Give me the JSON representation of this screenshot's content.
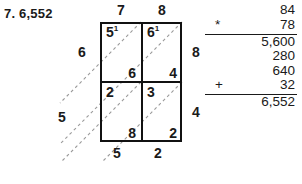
{
  "problem": {
    "number": "7.",
    "answer": "6,552"
  },
  "lattice": {
    "top_labels": [
      "7",
      "8"
    ],
    "right_labels": [
      "8",
      "4"
    ],
    "left_labels": [
      "6"
    ],
    "cells": [
      {
        "upper": "5",
        "carry": "1",
        "lower": "6"
      },
      {
        "upper": "6",
        "carry": "1",
        "lower": "4"
      },
      {
        "upper": "2",
        "carry": "",
        "lower": "8"
      },
      {
        "upper": "3",
        "carry": "",
        "lower": "2"
      }
    ],
    "sums": {
      "left": "5",
      "bottom": [
        "5",
        "2"
      ]
    }
  },
  "algorithm": {
    "multiplicand": "84",
    "multiplier": "78",
    "multiply_sign": "*",
    "partials": [
      "5,600",
      "280",
      "640",
      "32"
    ],
    "plus_sign": "+",
    "total": "6,552"
  },
  "colors": {
    "ink": "#1a1a1a",
    "grid": "#111111",
    "diagonal": "#9a9a9a"
  }
}
